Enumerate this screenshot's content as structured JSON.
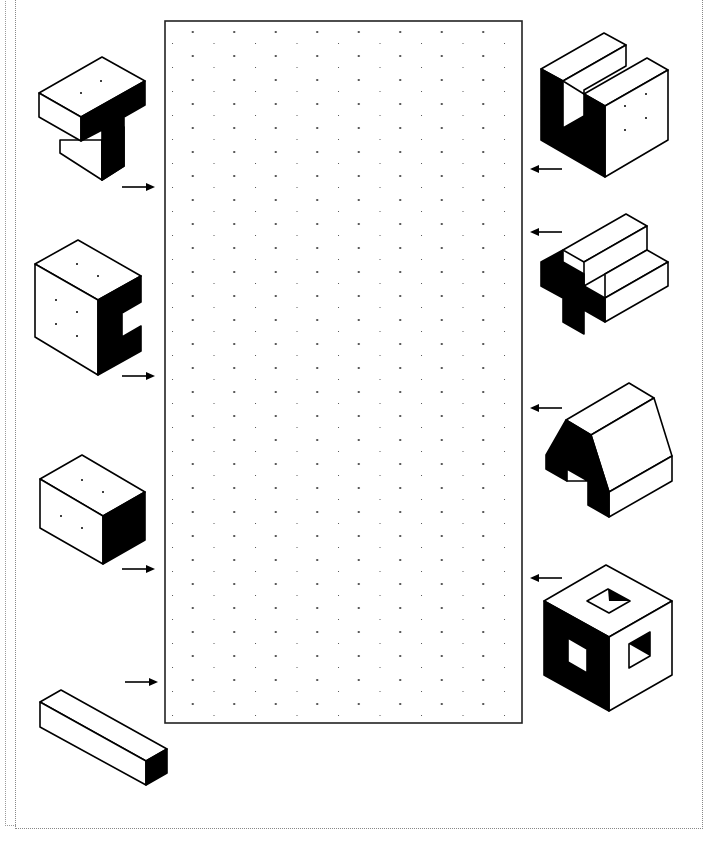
{
  "worksheet": {
    "title": "",
    "grid": {
      "type": "isometric-dot-grid",
      "x": 165,
      "y": 21,
      "width": 357,
      "height": 702,
      "dot_spacing_x": 41,
      "row_spacing_y": 12
    },
    "left_shapes": [
      {
        "id": "t-block",
        "name": "T-shaped block",
        "arrow": "right"
      },
      {
        "id": "c-block",
        "name": "C-notched block",
        "arrow": "right"
      },
      {
        "id": "rect-prism",
        "name": "rectangular prism",
        "arrow": "right"
      },
      {
        "id": "long-bar",
        "name": "long bar prism",
        "arrow": "right"
      }
    ],
    "right_shapes": [
      {
        "id": "u-block",
        "name": "U-shaped block",
        "arrow": "left"
      },
      {
        "id": "cross-block",
        "name": "cross-shaped block",
        "arrow": "left"
      },
      {
        "id": "arch-block",
        "name": "arch / barn block",
        "arrow": "left"
      },
      {
        "id": "hollow-cube",
        "name": "cube with square holes",
        "arrow": "left"
      }
    ],
    "colors": {
      "ink": "#000000",
      "paper": "#ffffff",
      "dot": "#333333"
    }
  }
}
